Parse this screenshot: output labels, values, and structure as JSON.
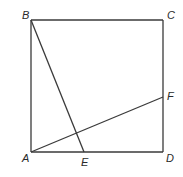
{
  "diagram": {
    "type": "geometry-square",
    "stroke_color": "#3a3a3a",
    "label_color": "#2a2a2a",
    "points": {
      "A": {
        "label": "A",
        "x": 31,
        "y": 152
      },
      "B": {
        "label": "B",
        "x": 31,
        "y": 20
      },
      "C": {
        "label": "C",
        "x": 163,
        "y": 20
      },
      "D": {
        "label": "D",
        "x": 163,
        "y": 152
      },
      "E": {
        "label": "E",
        "x": 84,
        "y": 152
      },
      "F": {
        "label": "F",
        "x": 163,
        "y": 97
      }
    },
    "labels": [
      {
        "id": "A",
        "text": "A",
        "x": 22,
        "y": 162
      },
      {
        "id": "B",
        "text": "B",
        "x": 22,
        "y": 19
      },
      {
        "id": "C",
        "text": "C",
        "x": 167,
        "y": 19
      },
      {
        "id": "D",
        "text": "D",
        "x": 166,
        "y": 162
      },
      {
        "id": "E",
        "text": "E",
        "x": 81,
        "y": 166
      },
      {
        "id": "F",
        "text": "F",
        "x": 167,
        "y": 100
      }
    ],
    "segments": [
      {
        "from": "A",
        "to": "B",
        "name": "side-AB"
      },
      {
        "from": "B",
        "to": "C",
        "name": "side-BC"
      },
      {
        "from": "C",
        "to": "D",
        "name": "side-CD"
      },
      {
        "from": "D",
        "to": "A",
        "name": "side-DA"
      },
      {
        "from": "B",
        "to": "E",
        "name": "segment-BE"
      },
      {
        "from": "A",
        "to": "F",
        "name": "segment-AF"
      }
    ]
  }
}
